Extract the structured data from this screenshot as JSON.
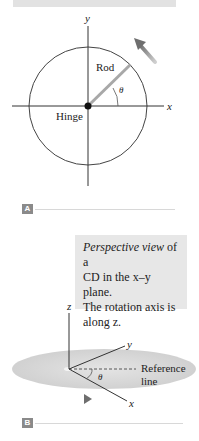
{
  "panel_a": {
    "tag": "A",
    "axis_x": "x",
    "axis_y": "y",
    "rod_label": "Rod",
    "hinge_label": "Hinge",
    "angle_label": "θ",
    "rotation_arrow": "counterclockwise-arrow"
  },
  "panel_b": {
    "tag": "B",
    "caption_italic": "Perspective view",
    "caption_rest_1": " of a",
    "caption_line2": "CD in the x–y plane.",
    "caption_line3": "The rotation axis is",
    "caption_line4": "along z.",
    "axis_x": "x",
    "axis_y": "y",
    "axis_z": "z",
    "angle_label": "θ",
    "reference_label_1": "Reference",
    "reference_label_2": "line",
    "motion_arrow": "right-arrow"
  },
  "colors": {
    "caption_bg": "#e7e7e7",
    "rod": "#a8a8a8",
    "disc": "#d4d4d4",
    "arrow": "#7a7a7a",
    "tag_bg": "#8a8a8a"
  }
}
